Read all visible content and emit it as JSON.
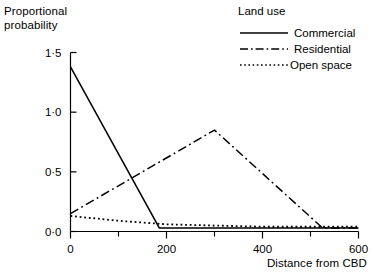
{
  "chart_data": {
    "type": "line",
    "title": "",
    "xlabel": "Distance from CBD",
    "ylabel": "Proportional probability",
    "ylabel_lines": [
      "Proportional",
      "probability"
    ],
    "xlim": [
      0,
      600
    ],
    "ylim": [
      0.0,
      1.5
    ],
    "grid": false,
    "legend_position": "top-right",
    "legend_title": "Land use",
    "x_ticks": [
      0,
      200,
      400,
      600
    ],
    "x_tick_labels": [
      "0",
      "200",
      "400",
      "600"
    ],
    "x_minor_ticks": [
      100,
      300,
      500
    ],
    "y_ticks": [
      0.0,
      0.5,
      1.0,
      1.5
    ],
    "y_tick_labels": [
      "0·0",
      "0·5",
      "1·0",
      "1·5"
    ],
    "series": [
      {
        "name": "Commercial",
        "style": "solid",
        "color": "#000000",
        "x": [
          0,
          185,
          200,
          400,
          600
        ],
        "values": [
          1.38,
          0.03,
          0.03,
          0.03,
          0.03
        ]
      },
      {
        "name": "Residential",
        "style": "dash-dot",
        "color": "#000000",
        "x": [
          0,
          300,
          525,
          600
        ],
        "values": [
          0.15,
          0.85,
          0.03,
          0.03
        ]
      },
      {
        "name": "Open space",
        "style": "dotted",
        "color": "#000000",
        "x": [
          0,
          100,
          200,
          300,
          400,
          600
        ],
        "values": [
          0.13,
          0.09,
          0.06,
          0.05,
          0.04,
          0.04
        ]
      }
    ]
  },
  "legend": {
    "title": "Land use",
    "entries": [
      {
        "label": "Commercial",
        "style": "solid"
      },
      {
        "label": "Residential",
        "style": "dash-dot"
      },
      {
        "label": "Open space",
        "style": "dotted"
      }
    ]
  },
  "axes": {
    "y_caption_line1": "Proportional",
    "y_caption_line2": "probability",
    "x_caption": "Distance from CBD"
  }
}
